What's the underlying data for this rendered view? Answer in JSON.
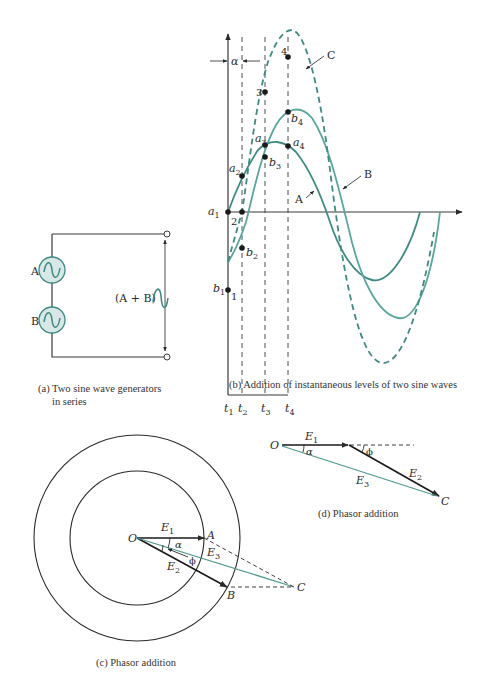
{
  "colors": {
    "wire": "#3a3a3a",
    "wave_a": "#3f8a82",
    "wave_b": "#5aa69c",
    "wave_c_dashed": "#3f8a82",
    "generator_fill": "#d7e8e6",
    "phasor_e3": "#4f9a8f"
  },
  "panel_a": {
    "generator_a_label": "A",
    "generator_b_label": "B",
    "output_label": "(A + B)",
    "caption_line1": "(a) Two sine wave generators",
    "caption_line2": "in series"
  },
  "panel_b": {
    "alpha_label": "α",
    "curve_labels": {
      "a": "A",
      "b": "B",
      "c": "C"
    },
    "points": {
      "a1": "a",
      "a1_sub": "1",
      "a2": "a",
      "a2_sub": "2",
      "a3": "a",
      "a3_sub": "3",
      "a4": "a",
      "a4_sub": "4",
      "b1": "b",
      "b1_sub": "1",
      "b2": "b",
      "b2_sub": "2",
      "b3": "b",
      "b3_sub": "3",
      "b4": "b",
      "b4_sub": "4",
      "n1": "1",
      "n2": "2",
      "n3": "3",
      "n4": "4"
    },
    "time_ticks": [
      {
        "t": "t",
        "sub": "1"
      },
      {
        "t": "t",
        "sub": "2"
      },
      {
        "t": "t",
        "sub": "3"
      },
      {
        "t": "t",
        "sub": "4"
      }
    ],
    "caption": "(b) Addition of instantaneous levels of two sine waves"
  },
  "panel_c": {
    "origin": "O",
    "point_a": "A",
    "point_b": "B",
    "point_c": "C",
    "e1": "E",
    "e1_sub": "1",
    "e2": "E",
    "e2_sub": "2",
    "e3": "E",
    "e3_sub": "3",
    "alpha": "α",
    "phi": "ϕ",
    "caption": "(c) Phasor addition"
  },
  "panel_d": {
    "origin": "O",
    "point_c": "C",
    "e1": "E",
    "e1_sub": "1",
    "e2": "E",
    "e2_sub": "2",
    "e3": "E",
    "e3_sub": "3",
    "alpha": "α",
    "phi": "ϕ",
    "caption": "(d) Phasor addition"
  }
}
